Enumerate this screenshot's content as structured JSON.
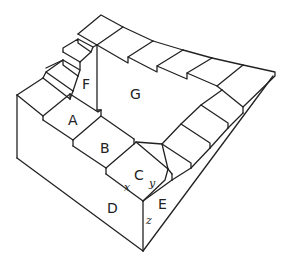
{
  "figure": {
    "face_labels": {
      "A": "A",
      "B": "B",
      "C": "C",
      "D": "D",
      "E": "E",
      "F": "F",
      "G": "G"
    },
    "edge_labels": {
      "x": "x",
      "y": "y",
      "z": "z"
    },
    "colors": {
      "line": "#222222",
      "background": "#ffffff"
    }
  }
}
